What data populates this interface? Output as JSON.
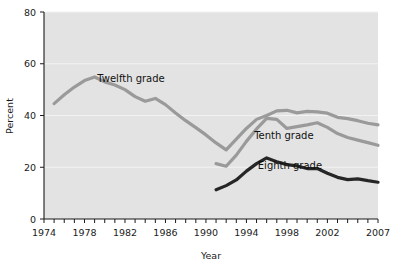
{
  "chart_data": {
    "type": "line",
    "title": "",
    "xlabel": "Year",
    "ylabel": "Percent",
    "xlim": [
      1974,
      2007
    ],
    "ylim": [
      0,
      80
    ],
    "yticks": [
      0,
      20,
      40,
      60,
      80
    ],
    "ytick_labels": [
      "0",
      "20",
      "40",
      "60",
      "80"
    ],
    "xticks": [
      1974,
      1978,
      1982,
      1986,
      1990,
      1994,
      1998,
      2002,
      2007
    ],
    "xtick_labels": [
      "1974",
      "1978",
      "1982",
      "1986",
      "1990",
      "1994",
      "1998",
      "2002",
      "2007"
    ],
    "minor_xticks_every": 1,
    "grid": "horizontal",
    "legend": "inline-labels",
    "plot_background": "#e3e3e3",
    "series": [
      {
        "name": "Twelfth grade",
        "color": "#9a9a9a",
        "label_x": 1982.6,
        "label_y": 53.0,
        "x": [
          1975,
          1976,
          1977,
          1978,
          1979,
          1980,
          1981,
          1982,
          1983,
          1984,
          1985,
          1986,
          1987,
          1988,
          1989,
          1990,
          1991,
          1992,
          1993,
          1994,
          1995,
          1996,
          1997,
          1998,
          1999,
          2000,
          2001,
          2002,
          2003,
          2004,
          2005,
          2006,
          2007
        ],
        "values": [
          44.6,
          48.0,
          51.0,
          53.5,
          54.9,
          53.0,
          51.8,
          50.0,
          47.3,
          45.5,
          46.6,
          44.2,
          41.0,
          38.0,
          35.3,
          32.5,
          29.4,
          26.7,
          30.9,
          35.0,
          38.5,
          40.0,
          41.8,
          42.0,
          41.0,
          41.6,
          41.4,
          40.9,
          39.3,
          38.8,
          38.0,
          37.0,
          36.4
        ]
      },
      {
        "name": "Tenth grade",
        "color": "#9a9a9a",
        "label_x": 1997.7,
        "label_y": 31.0,
        "x": [
          1991,
          1992,
          1993,
          1994,
          1995,
          1996,
          1997,
          1998,
          1999,
          2000,
          2001,
          2002,
          2003,
          2004,
          2005,
          2006,
          2007
        ],
        "values": [
          21.4,
          20.4,
          24.7,
          30.0,
          34.8,
          38.9,
          38.5,
          35.0,
          35.7,
          36.4,
          37.2,
          35.4,
          33.0,
          31.5,
          30.5,
          29.5,
          28.5
        ]
      },
      {
        "name": "Eighth grade",
        "color": "#262626",
        "label_x": 1998.3,
        "label_y": 19.2,
        "x": [
          1991,
          1992,
          1993,
          1994,
          1995,
          1996,
          1997,
          1998,
          1999,
          2000,
          2001,
          2002,
          2003,
          2004,
          2005,
          2006,
          2007
        ],
        "values": [
          11.3,
          12.9,
          15.1,
          18.5,
          21.4,
          23.6,
          22.1,
          21.0,
          20.5,
          19.5,
          19.5,
          17.7,
          16.1,
          15.2,
          15.5,
          14.8,
          14.2
        ]
      }
    ]
  }
}
